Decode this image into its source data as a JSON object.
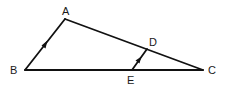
{
  "diagram": {
    "type": "geometry-triangle",
    "colors": {
      "stroke": "#111111",
      "label": "#1a1a1a",
      "background": "#ffffff"
    },
    "points": {
      "A": {
        "label": "A",
        "x": 65,
        "y": 19
      },
      "B": {
        "label": "B",
        "x": 25,
        "y": 70
      },
      "C": {
        "label": "C",
        "x": 203,
        "y": 70
      },
      "D": {
        "label": "D",
        "x": 147,
        "y": 49
      },
      "E": {
        "label": "E",
        "x": 132,
        "y": 70
      }
    },
    "segments": [
      {
        "from": "A",
        "to": "B",
        "parallel_marker": true
      },
      {
        "from": "A",
        "to": "C",
        "parallel_marker": false
      },
      {
        "from": "B",
        "to": "C",
        "parallel_marker": false
      },
      {
        "from": "E",
        "to": "D",
        "parallel_marker": true
      }
    ],
    "relations": [
      "AB ∥ ED"
    ]
  }
}
